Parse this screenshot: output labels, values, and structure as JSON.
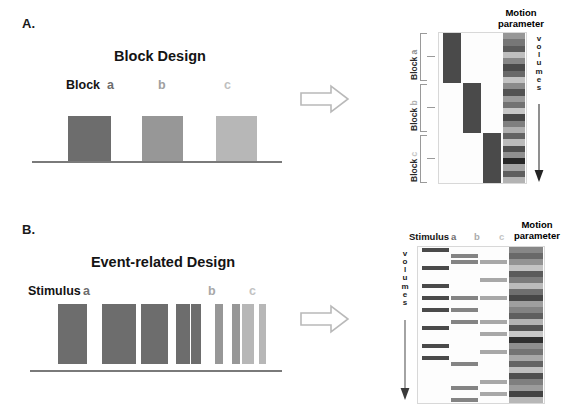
{
  "figure": {
    "panels": [
      {
        "letter": "A.",
        "title": "Block Design",
        "condition_prefix": "Stimulus",
        "labels": [
          "Block",
          "a",
          "b",
          "c"
        ]
      },
      {
        "letter": "B.",
        "title": "Event-related Design",
        "labels": [
          "Stimulus",
          "a",
          "b",
          "c"
        ]
      }
    ],
    "matrix_headers": {
      "motion_line1": "Motion",
      "motion_line2": "parameter",
      "stimulus": "Stimulus",
      "col_a": "a",
      "col_b": "b",
      "col_c": "c"
    },
    "volumes_axis": {
      "letters": [
        "v",
        "o",
        "l",
        "u",
        "m",
        "e",
        "s"
      ],
      "arrow": "down-arrow"
    },
    "block_brackets": [
      {
        "label": "Block",
        "sub": "a"
      },
      {
        "label": "Block",
        "sub": "b"
      },
      {
        "label": "Block",
        "sub": "c"
      }
    ],
    "transform_arrow": "right-block-arrow"
  },
  "colors": {
    "cond_a": "#6d6d6d",
    "cond_b": "#979797",
    "cond_c": "#b7b7b7",
    "matrix_on": "#4a4a4a",
    "baseline": "#7a7a7a",
    "text": "#141414",
    "bracket": "#8a8a8a",
    "matrix_border": "#d8d8d8",
    "mp_bg": "#b0b0b0"
  },
  "chart_data": {
    "type": "heatmap",
    "panel_a": {
      "design": "block",
      "schematic": {
        "type": "bar",
        "categories": [
          "a",
          "b",
          "c"
        ],
        "values": [
          1,
          1,
          1
        ],
        "bar_shades": [
          "#6d6d6d",
          "#979797",
          "#b7b7b7"
        ],
        "xlabel": "time",
        "ylabel": "stimulus on/off"
      },
      "matrix": {
        "columns": [
          "a",
          "b",
          "c",
          "motion parameter"
        ],
        "n_volumes": 24,
        "regressors": [
          {
            "name": "a",
            "on_rows": [
              0,
              1,
              2,
              3,
              4,
              5,
              6,
              7
            ]
          },
          {
            "name": "b",
            "on_rows": [
              8,
              9,
              10,
              11,
              12,
              13,
              14,
              15
            ]
          },
          {
            "name": "c",
            "on_rows": [
              16,
              17,
              18,
              19,
              20,
              21,
              22,
              23
            ]
          }
        ],
        "motion_parameter_values": [
          0.32,
          0.48,
          0.62,
          0.12,
          0.4,
          0.7,
          0.55,
          0.1,
          0.38,
          0.66,
          0.3,
          0.5,
          0.08,
          0.72,
          0.44,
          0.2,
          0.58,
          0.14,
          0.68,
          0.36,
          0.88,
          0.26,
          0.6,
          0.18
        ]
      }
    },
    "panel_b": {
      "design": "event-related",
      "schematic": {
        "type": "bar",
        "xlabel": "time",
        "ylabel": "stimulus on/off",
        "events": [
          {
            "pos": 4,
            "w": 2.6,
            "cond": "a"
          },
          {
            "pos": 7,
            "w": 1.6,
            "cond": "a"
          },
          {
            "pos": 9,
            "w": 2.2,
            "cond": "a"
          },
          {
            "pos": 13,
            "w": 1.1,
            "cond": "a"
          },
          {
            "pos": 22,
            "w": 2.4,
            "cond": "a"
          },
          {
            "pos": 25,
            "w": 2.0,
            "cond": "a"
          },
          {
            "pos": 28,
            "w": 2.6,
            "cond": "a"
          },
          {
            "pos": 32,
            "w": 1.8,
            "cond": "a"
          },
          {
            "pos": 38,
            "w": 2.2,
            "cond": "a"
          },
          {
            "pos": 41,
            "w": 1.6,
            "cond": "a"
          },
          {
            "pos": 44,
            "w": 2.4,
            "cond": "a"
          },
          {
            "pos": 52,
            "w": 1.4,
            "cond": "a"
          },
          {
            "pos": 55,
            "w": 1.2,
            "cond": "a"
          },
          {
            "pos": 58,
            "w": 2.2,
            "cond": "a"
          },
          {
            "pos": 68,
            "w": 1.4,
            "cond": "b"
          },
          {
            "pos": 75,
            "w": 1.3,
            "cond": "b"
          },
          {
            "pos": 79,
            "w": 2.4,
            "cond": "c"
          },
          {
            "pos": 86,
            "w": 1.2,
            "cond": "c"
          }
        ]
      },
      "matrix": {
        "columns": [
          "a",
          "b",
          "c",
          "motion parameter"
        ],
        "n_volumes": 26,
        "regressors": [
          {
            "name": "a",
            "on_rows": [
              0,
              3,
              6,
              8,
              10,
              13,
              16,
              18
            ]
          },
          {
            "name": "b",
            "on_rows": [
              1,
              2,
              8,
              10,
              12,
              19,
              23,
              25
            ]
          },
          {
            "name": "c",
            "on_rows": [
              2,
              5,
              8,
              12,
              14,
              17,
              22,
              24
            ]
          }
        ],
        "motion_parameter_values": [
          0.4,
          0.55,
          0.34,
          0.1,
          0.62,
          0.46,
          0.14,
          0.52,
          0.72,
          0.28,
          0.42,
          0.6,
          0.18,
          0.66,
          0.08,
          0.84,
          0.36,
          0.5,
          0.24,
          0.58,
          0.12,
          0.68,
          0.44,
          0.3,
          0.74,
          0.16
        ]
      }
    }
  }
}
